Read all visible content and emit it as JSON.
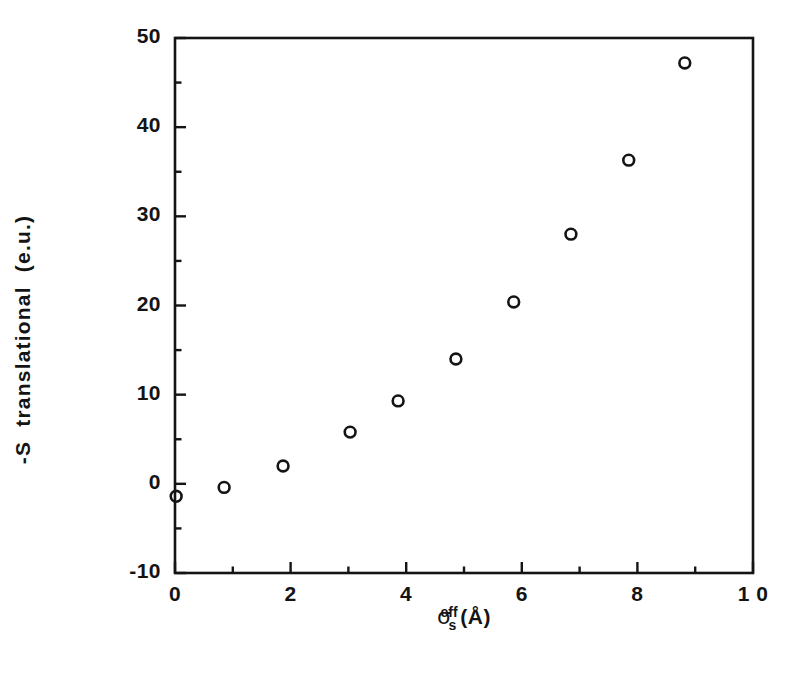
{
  "figure": {
    "background_color": "#ffffff",
    "ink_color": "#141414",
    "marker_style": "open-circle"
  },
  "axes": {
    "x": {
      "label_prefix": "σ",
      "label_sub": "s",
      "label_sup": "eff",
      "label_unit": "(Å)",
      "label_full": "σs_eff (Å)",
      "min": 0,
      "max": 10,
      "major_ticks": [
        0,
        2,
        4,
        6,
        8,
        10
      ],
      "major_tick_labels": [
        "0",
        "2",
        "4",
        "6",
        "8",
        "1 0"
      ],
      "minor_ticks": [
        1,
        3,
        5,
        7,
        9
      ]
    },
    "y": {
      "label": "-S  translational  (e.u.)",
      "min": -10,
      "max": 50,
      "major_ticks": [
        -10,
        0,
        10,
        20,
        30,
        40,
        50
      ],
      "major_tick_labels": [
        "-10",
        "0",
        "10",
        "20",
        "30",
        "40",
        "50"
      ],
      "minor_ticks": [
        -5,
        5,
        15,
        25,
        35,
        45
      ]
    }
  },
  "chart_data": {
    "type": "scatter",
    "title": "",
    "xlabel": "σs^eff (Å)",
    "ylabel": "-S translational (e.u.)",
    "xlim": [
      0,
      10
    ],
    "ylim": [
      -10,
      50
    ],
    "grid": false,
    "legend": false,
    "series": [
      {
        "name": "-S translational",
        "marker": "open-circle",
        "x": [
          0.02,
          0.85,
          1.87,
          3.03,
          3.86,
          4.86,
          5.86,
          6.85,
          7.85,
          8.82
        ],
        "y": [
          -1.4,
          -0.4,
          2.0,
          5.8,
          9.3,
          14.0,
          20.4,
          28.0,
          36.3,
          47.2
        ]
      }
    ]
  }
}
